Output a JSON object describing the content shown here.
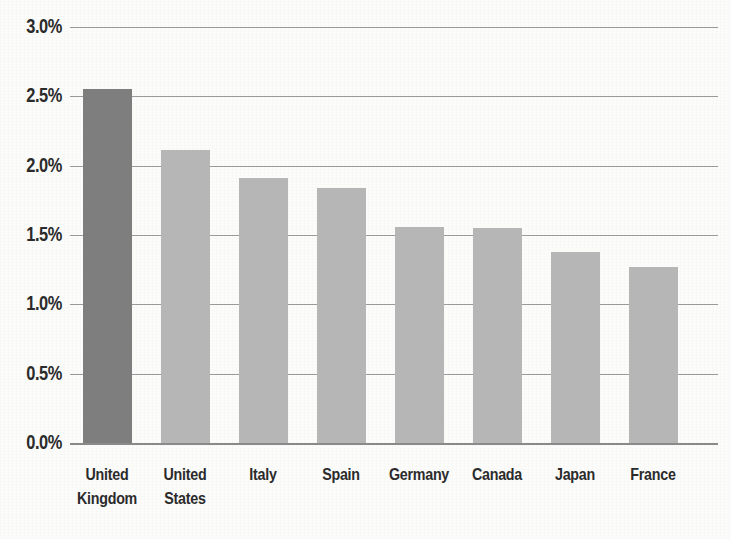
{
  "chart_data": {
    "type": "bar",
    "title": "",
    "subtitle": "",
    "xlabel": "",
    "ylabel": "",
    "categories": [
      "United\nKingdom",
      "United\nStates",
      "Italy",
      "Spain",
      "Germany",
      "Canada",
      "Japan",
      "France"
    ],
    "values": [
      2.55,
      2.11,
      1.91,
      1.84,
      1.56,
      1.55,
      1.38,
      1.27
    ],
    "value_suffix": "%",
    "ylim": [
      0.0,
      3.0
    ],
    "ytick_labels": [
      "3.0%",
      "2.5%",
      "2.0%",
      "1.5%",
      "1.0%",
      "0.5%",
      "0.0%"
    ],
    "ytick_values": [
      3.0,
      2.5,
      2.0,
      1.5,
      1.0,
      0.5,
      0.0
    ],
    "grid": "horizontal",
    "legend": "none",
    "highlighted_category": "United Kingdom",
    "colors": {
      "bar": "#b6b6b6",
      "bar_highlight": "#7e7e7e",
      "gridline": "#9a9a9a",
      "axis": "#8a8a8a",
      "text": "#2b2b2b",
      "background": "#fcfcfb"
    }
  }
}
